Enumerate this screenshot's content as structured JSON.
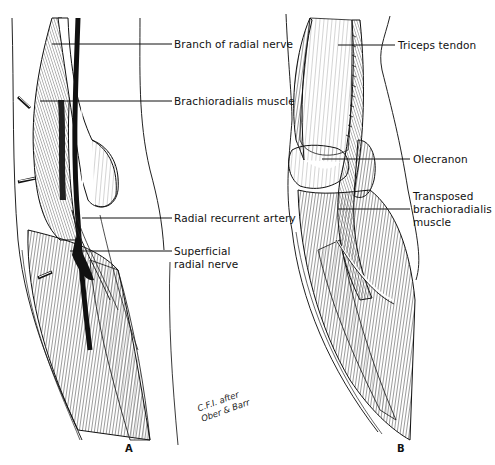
{
  "figure": {
    "panels": [
      {
        "letter": "A",
        "labels": [
          {
            "text": "Branch of radial nerve"
          },
          {
            "text": "Brachioradialis muscle"
          },
          {
            "text": "Radial recurrent artery"
          },
          {
            "text": "Superficial",
            "text2": "radial nerve"
          }
        ],
        "credit_line1": "C.F.I. after",
        "credit_line2": "Ober & Barr"
      },
      {
        "letter": "B",
        "labels": [
          {
            "text": "Triceps tendon"
          },
          {
            "text": "Olecranon"
          },
          {
            "text": "Transposed",
            "text2": "brachioradialis",
            "text3": "muscle"
          }
        ]
      }
    ]
  }
}
